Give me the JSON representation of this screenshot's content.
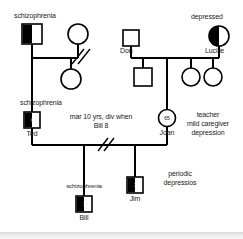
{
  "diagram": {
    "type": "genogram",
    "stroke_color": "#000000",
    "fill_color": "#000000",
    "background": "#ffffff"
  },
  "labels": {
    "gen1_left_schizophrenia": "schizophrenia",
    "gen1_right_depressed": "depressed",
    "don": "Don",
    "lucille": "Lucille",
    "gen2_left_schizophrenia": "schizophrenia",
    "ted": "Ted",
    "joan": "Joan",
    "marriage_note_line1": "mar 10 yrs, div when",
    "marriage_note_line2": "Bill 8",
    "joan_note_line1": "teacher",
    "joan_note_line2": "mild caregiver",
    "joan_note_line3": "depression",
    "bill_schizophrenia": "schizophrenia",
    "bill": "Bill",
    "jim": "Jim",
    "jim_note_line1": "periodic",
    "jim_note_line2": "depressios"
  },
  "people": [
    {
      "id": "grandfather-left",
      "shape": "square",
      "sex": "male",
      "fill": "left-half",
      "condition": "schizophrenia",
      "age": "",
      "name": ""
    },
    {
      "id": "grandmother-left",
      "shape": "circle",
      "sex": "female",
      "fill": "none",
      "condition": "",
      "age": "",
      "name": ""
    },
    {
      "id": "aunt-left",
      "shape": "circle",
      "sex": "female",
      "fill": "none",
      "condition": "",
      "age": "",
      "name": ""
    },
    {
      "id": "don",
      "shape": "square",
      "sex": "male",
      "fill": "none",
      "condition": "",
      "age": "",
      "name": "Don"
    },
    {
      "id": "lucille",
      "shape": "circle",
      "sex": "female",
      "fill": "left-half",
      "condition": "depressed",
      "age": "",
      "name": "Lucille"
    },
    {
      "id": "uncle-1",
      "shape": "square",
      "sex": "male",
      "fill": "none",
      "condition": "",
      "age": "",
      "name": ""
    },
    {
      "id": "aunt-1",
      "shape": "circle",
      "sex": "female",
      "fill": "none",
      "condition": "",
      "age": "",
      "name": ""
    },
    {
      "id": "aunt-2",
      "shape": "circle",
      "sex": "female",
      "fill": "none",
      "condition": "",
      "age": "",
      "name": ""
    },
    {
      "id": "ted",
      "shape": "square",
      "sex": "male",
      "fill": "left-half",
      "condition": "schizophrenia",
      "age": "61",
      "name": "Ted"
    },
    {
      "id": "joan",
      "shape": "circle",
      "sex": "female",
      "fill": "none",
      "condition": "mild caregiver depression",
      "age": "65",
      "name": "Joan"
    },
    {
      "id": "bill",
      "shape": "square",
      "sex": "male",
      "fill": "left-half",
      "condition": "schizophrenia",
      "age": "30",
      "name": "Bill"
    },
    {
      "id": "jim",
      "shape": "square",
      "sex": "male",
      "fill": "left-half",
      "condition": "periodic depressions",
      "age": "27",
      "name": "Jim"
    }
  ],
  "relationships": [
    {
      "id": "rel-grandparents-left",
      "type": "divorced",
      "marker": "double-slash"
    },
    {
      "id": "rel-don-lucille",
      "type": "married",
      "marker": "none"
    },
    {
      "id": "rel-ted-joan",
      "type": "divorced",
      "marker": "double-slash",
      "note": "mar 10 yrs, div when Bill 8"
    }
  ]
}
